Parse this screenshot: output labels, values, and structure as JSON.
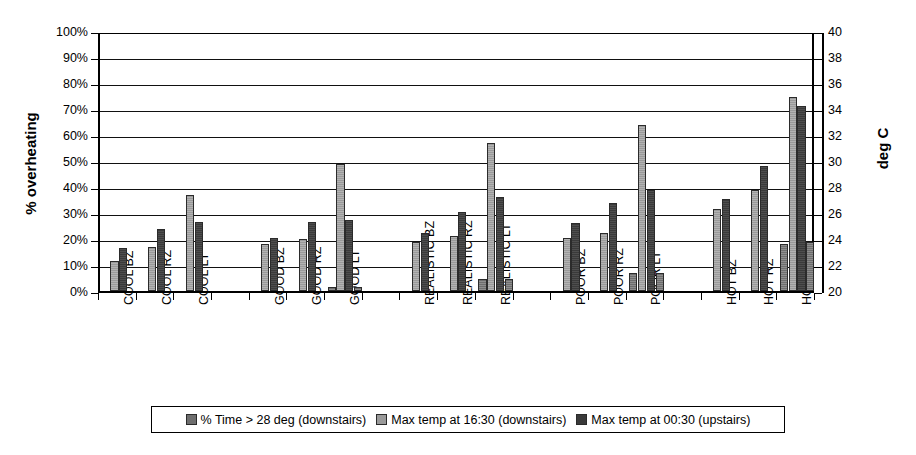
{
  "chart_data": {
    "type": "bar",
    "title": "",
    "subtitle": "",
    "categories": [
      "COOL BZ",
      "COOL RZ",
      "COOL LT",
      "",
      "GOOD BZ",
      "GOOD RZ",
      "GOOD LT",
      "",
      "REALISTIC BZ",
      "REALISTIC RZ",
      "REALISTIC LT",
      "",
      "POOR BZ",
      "POOR RZ",
      "POOR LT",
      "",
      "HOT BZ",
      "HOT RZ",
      "HOT LT"
    ],
    "series": [
      {
        "name": "% Time > 28 deg (downstairs)",
        "axis": "left",
        "unit": "%",
        "color": "#6e6e6e",
        "values": [
          0,
          0,
          0,
          null,
          0,
          0,
          1.5,
          null,
          0,
          0,
          4.5,
          null,
          0,
          0,
          7,
          null,
          0,
          0,
          18
        ]
      },
      {
        "name": "Max temp at 16:30 (downstairs)",
        "axis": "right",
        "unit": "deg C",
        "color": "#9a9a9a",
        "values": [
          11.5,
          17,
          37,
          null,
          18,
          20,
          49,
          null,
          19,
          21,
          57,
          null,
          20.5,
          22.5,
          64,
          null,
          31.5,
          39,
          74.5
        ]
      },
      {
        "name": "Max temp at 00:30 (upstairs)",
        "axis": "right",
        "unit": "deg C",
        "color": "#3a3a3a",
        "values": [
          16.5,
          24,
          26.5,
          null,
          20.5,
          26.5,
          27.5,
          null,
          22.5,
          30.5,
          36,
          null,
          26,
          34,
          39,
          null,
          35.5,
          48,
          71
        ]
      }
    ],
    "series4_trailing": {
      "name": "trailing marker",
      "color": "#6e6e6e",
      "values": [
        0,
        0,
        0,
        null,
        0,
        0,
        1.5,
        null,
        0,
        0,
        4.5,
        null,
        0,
        0,
        7,
        null,
        0,
        0,
        19
      ]
    },
    "left_axis": {
      "label": "% overheating",
      "ticks": [
        "0%",
        "10%",
        "20%",
        "30%",
        "40%",
        "50%",
        "60%",
        "70%",
        "80%",
        "90%",
        "100%"
      ],
      "min": 0,
      "max": 100,
      "step": 10
    },
    "right_axis": {
      "label": "deg C",
      "ticks": [
        "20",
        "22",
        "24",
        "26",
        "28",
        "30",
        "32",
        "34",
        "36",
        "38",
        "40"
      ],
      "min": 20,
      "max": 40,
      "step": 2
    },
    "grid": true,
    "legend_position": "bottom",
    "legend": [
      "% Time > 28 deg (downstairs)",
      "Max temp at 16:30 (downstairs)",
      "Max temp at 00:30 (upstairs)"
    ]
  }
}
